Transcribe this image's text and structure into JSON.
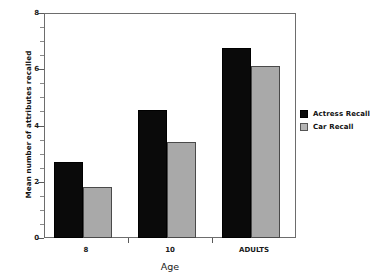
{
  "chart_data": {
    "type": "bar",
    "title": "",
    "xlabel": "Age",
    "ylabel": "Mean number of attributes recalled",
    "categories": [
      "8",
      "10",
      "ADULTS"
    ],
    "series": [
      {
        "name": "Actress Recall",
        "color": "#0a0a0a",
        "values": [
          2.7,
          4.55,
          6.75
        ]
      },
      {
        "name": "Car Recall",
        "color": "#a9a9a9",
        "values": [
          1.8,
          3.4,
          6.1
        ]
      }
    ],
    "ylim": [
      0,
      8
    ],
    "ytick_labels": [
      "0",
      "2",
      "4",
      "6",
      "8"
    ],
    "ytick_values": [
      0,
      2,
      4,
      6,
      8
    ],
    "yminor_values": [
      0.5,
      1,
      1.5,
      2.5,
      3,
      3.5,
      4.5,
      5,
      5.5,
      6.5,
      7,
      7.5
    ],
    "grid": false,
    "legend_position": "right"
  }
}
